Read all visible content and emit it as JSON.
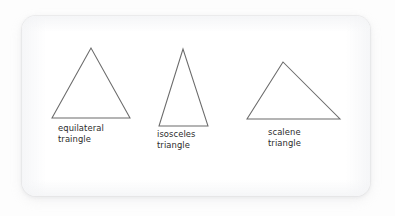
{
  "figure": {
    "background_color": "#fdfdfd",
    "card_color": "#ffffff",
    "stroke_color": "#6b6b6b",
    "text_color": "#2b2b2b",
    "shapes": [
      {
        "name": "equilateral-triangle",
        "label_line1": "equilateral",
        "label_line2": "traingle",
        "points": "91,48 52,118 130,118"
      },
      {
        "name": "isosceles-triangle",
        "label_line1": "isosceles",
        "label_line2": "triangle",
        "points": "183,49 159,126 208,126"
      },
      {
        "name": "scalene-triangle",
        "label_line1": "scalene",
        "label_line2": "triangle",
        "points": "283,62 247,119 340,119"
      }
    ],
    "labels": {
      "equilateral": "equilateral\ntraingle",
      "isosceles": "isosceles\ntriangle",
      "scalene": "scalene\ntriangle"
    }
  }
}
